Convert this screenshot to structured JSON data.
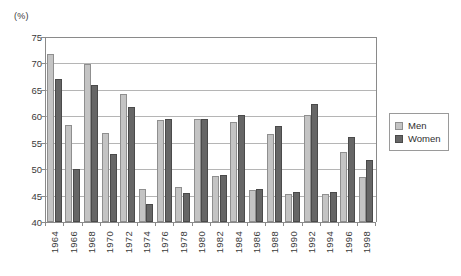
{
  "chart_data": {
    "type": "bar",
    "title": "",
    "subtitle": "",
    "xlabel": "",
    "ylabel": "",
    "unit_label": "(%)",
    "ylim": [
      40,
      75
    ],
    "y_ticks": [
      40,
      45,
      50,
      55,
      60,
      65,
      70,
      75
    ],
    "grid": true,
    "legend_position": "right",
    "categories": [
      "1964",
      "1966",
      "1968",
      "1970",
      "1972",
      "1974",
      "1976",
      "1978",
      "1980",
      "1982",
      "1984",
      "1986",
      "1988",
      "1990",
      "1992",
      "1994",
      "1996",
      "1998"
    ],
    "series": [
      {
        "name": "Men",
        "color": "#c4c4c4",
        "values": [
          71.8,
          58.3,
          69.9,
          56.9,
          64.2,
          46.3,
          59.3,
          46.6,
          59.4,
          48.7,
          59.0,
          46.0,
          56.6,
          45.3,
          60.3,
          45.3,
          53.2,
          48.5
        ]
      },
      {
        "name": "Women",
        "color": "#666666",
        "values": [
          67.1,
          50.1,
          66.0,
          52.8,
          61.8,
          43.4,
          59.5,
          45.4,
          59.5,
          48.9,
          60.3,
          46.3,
          58.2,
          45.6,
          62.4,
          45.6,
          56.1,
          51.7
        ]
      }
    ]
  },
  "legend": {
    "items": [
      {
        "label": "Men",
        "color": "#c4c4c4"
      },
      {
        "label": "Women",
        "color": "#666666"
      }
    ]
  }
}
